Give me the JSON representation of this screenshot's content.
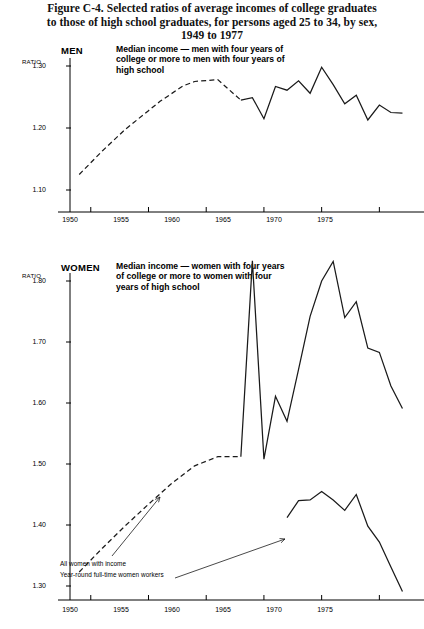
{
  "figure": {
    "title_lines": [
      "Figure C-4. Selected ratios of average incomes of college graduates",
      "to those of high school graduates, for persons aged 25 to 34, by sex,",
      "1949 to 1977"
    ]
  },
  "panels": {
    "men": {
      "label": "MEN",
      "ratio_label": "RATIO",
      "caption": "Median income — men with four years of college or more to men with four years of high school"
    },
    "women": {
      "label": "WOMEN",
      "ratio_label": "RATIO",
      "caption": "Median income — women with four years of college or more to women with four years of high school",
      "annotations": [
        "All women with income",
        "Year-round full-time women workers"
      ]
    }
  },
  "chart_data": [
    {
      "type": "line",
      "title": "MEN",
      "subtitle": "Median income — men with four years of college or more to men with four years of high school",
      "xlabel": "",
      "ylabel": "RATIO",
      "xlim": [
        1948.2,
        1978.0
      ],
      "ylim": [
        1.075,
        1.325
      ],
      "xticks": [
        1950,
        1955,
        1960,
        1965,
        1970,
        1975
      ],
      "yticks": [
        1.1,
        1.2,
        1.3
      ],
      "ytick_labels": [
        "1.10",
        "1.20",
        "1.30"
      ],
      "grid": false,
      "legend": "none",
      "series": [
        {
          "name": "Median income ratio, men",
          "style": "dashed-then-solid",
          "dashed_until": 1963,
          "x": [
            1949,
            1951,
            1953,
            1955,
            1956,
            1958,
            1959,
            1961,
            1963,
            1964,
            1965,
            1966,
            1967,
            1968,
            1969,
            1970,
            1971,
            1972,
            1973,
            1974,
            1975,
            1976,
            1977
          ],
          "values": [
            1.125,
            1.163,
            1.198,
            1.228,
            1.243,
            1.268,
            1.275,
            1.278,
            1.245,
            1.249,
            1.215,
            1.267,
            1.261,
            1.276,
            1.256,
            1.298,
            1.27,
            1.239,
            1.253,
            1.213,
            1.237,
            1.225,
            1.224
          ]
        }
      ]
    },
    {
      "type": "line",
      "title": "WOMEN",
      "subtitle": "Median income — women with four years of college or more to women with four years of high school",
      "xlabel": "",
      "ylabel": "RATIO",
      "xlim": [
        1948.2,
        1978.0
      ],
      "ylim": [
        1.268,
        1.845
      ],
      "xticks": [
        1950,
        1955,
        1960,
        1965,
        1970,
        1975
      ],
      "yticks": [
        1.3,
        1.4,
        1.5,
        1.6,
        1.7,
        1.8
      ],
      "ytick_labels": [
        "1.30",
        "1.40",
        "1.50",
        "1.60",
        "1.70",
        "1.80"
      ],
      "grid": false,
      "legend": "annotated",
      "series": [
        {
          "name": "All women with income",
          "style": "dashed-then-solid",
          "dashed_until": 1963,
          "x": [
            1949,
            1951,
            1953,
            1955,
            1957,
            1959,
            1961,
            1963,
            1964,
            1965,
            1966,
            1967,
            1968,
            1969,
            1970,
            1971,
            1972,
            1973,
            1974,
            1975,
            1976,
            1977
          ],
          "values": [
            1.323,
            1.362,
            1.399,
            1.434,
            1.468,
            1.497,
            1.512,
            1.512,
            1.833,
            1.508,
            1.611,
            1.57,
            1.655,
            1.742,
            1.8,
            1.832,
            1.74,
            1.766,
            1.69,
            1.683,
            1.628,
            1.591
          ]
        },
        {
          "name": "Year-round full-time women workers",
          "style": "solid",
          "x": [
            1967,
            1968,
            1969,
            1970,
            1971,
            1972,
            1973,
            1974,
            1975,
            1976,
            1977
          ],
          "values": [
            1.412,
            1.44,
            1.441,
            1.455,
            1.441,
            1.424,
            1.45,
            1.398,
            1.372,
            1.331,
            1.291
          ]
        }
      ]
    }
  ]
}
